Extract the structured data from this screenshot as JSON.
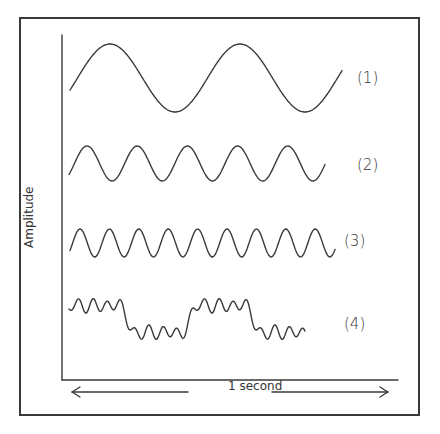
{
  "diagram": {
    "y_axis_label": "Amplitude",
    "x_axis_label": "1 second",
    "waves": [
      {
        "label": "(1)",
        "description": "low-frequency sine, 2 cycles per second"
      },
      {
        "label": "(2)",
        "description": "sine, 5 cycles per second"
      },
      {
        "label": "(3)",
        "description": "sine, 9 cycles per second"
      },
      {
        "label": "(4)",
        "description": "complex wave: 2-cycle square-like wave with high-frequency ripples"
      }
    ],
    "colors": {
      "line": "#3a3a3a",
      "background": "#ffffff"
    }
  }
}
